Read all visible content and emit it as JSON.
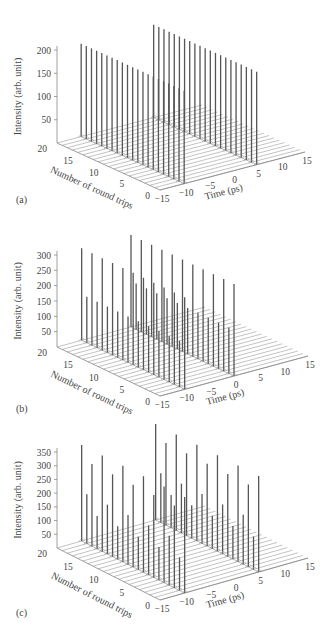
{
  "chart_data": [
    {
      "panel": "(a)",
      "type": "3d-waterfall",
      "xlabel": "Time (ps)",
      "ylabel": "Number of round trips",
      "zlabel": "Intensity (arb. unit)",
      "x_ticks": [
        "-15",
        "-10",
        "-5",
        "0",
        "5",
        "10",
        "15"
      ],
      "y_ticks": [
        "0",
        "5",
        "10",
        "15",
        "20"
      ],
      "z_ticks": [
        "50",
        "100",
        "150",
        "200"
      ],
      "xlim": [
        -15,
        15
      ],
      "ylim": [
        0,
        20
      ],
      "zlim": [
        0,
        200
      ],
      "description": "Two stable pulses per round trip at constant peak intensity",
      "pulse_times_ps": [
        -10,
        5
      ],
      "round_trips": [
        0,
        1,
        2,
        3,
        4,
        5,
        6,
        7,
        8,
        9,
        10,
        11,
        12,
        13,
        14,
        15,
        16,
        17,
        18,
        19,
        20
      ],
      "series": [
        {
          "name": "pulse at -10 ps",
          "values": [
            200,
            200,
            200,
            200,
            200,
            200,
            200,
            200,
            200,
            200,
            200,
            200,
            200,
            200,
            200,
            200,
            200,
            200,
            200,
            200,
            200
          ]
        },
        {
          "name": "pulse at 5 ps",
          "values": [
            200,
            200,
            200,
            200,
            200,
            200,
            200,
            200,
            200,
            200,
            200,
            200,
            200,
            200,
            200,
            200,
            200,
            200,
            200,
            200,
            200
          ]
        }
      ]
    },
    {
      "panel": "(b)",
      "type": "3d-waterfall",
      "xlabel": "Time (ps)",
      "ylabel": "Number of round trips",
      "zlabel": "Intensity (arb. unit)",
      "x_ticks": [
        "-15",
        "-10",
        "-5",
        "0",
        "5",
        "10",
        "15"
      ],
      "y_ticks": [
        "0",
        "5",
        "10",
        "15",
        "20"
      ],
      "z_ticks": [
        "50",
        "100",
        "150",
        "200",
        "250",
        "300"
      ],
      "xlim": [
        -15,
        15
      ],
      "ylim": [
        0,
        20
      ],
      "zlim": [
        0,
        300
      ],
      "description": "Two pulses per round trip with period-doubled (alternating) peak intensity",
      "pulse_times_ps": [
        -10,
        0
      ],
      "round_trips": [
        0,
        1,
        2,
        3,
        4,
        5,
        6,
        7,
        8,
        9,
        10,
        11,
        12,
        13,
        14,
        15,
        16,
        17,
        18,
        19,
        20
      ],
      "series": [
        {
          "name": "pulse at -10 ps",
          "values": [
            300,
            150,
            300,
            150,
            300,
            150,
            300,
            150,
            300,
            150,
            300,
            150,
            300,
            150,
            300,
            150,
            300,
            150,
            300,
            150,
            300
          ]
        },
        {
          "name": "pulse at 0 ps",
          "values": [
            300,
            150,
            300,
            150,
            300,
            150,
            300,
            150,
            300,
            150,
            300,
            150,
            300,
            150,
            300,
            150,
            300,
            150,
            300,
            150,
            300
          ]
        }
      ]
    },
    {
      "panel": "(c)",
      "type": "3d-waterfall",
      "xlabel": "Time (ps)",
      "ylabel": "Number of round trips",
      "zlabel": "Intensity (arb. unit)",
      "x_ticks": [
        "-15",
        "-10",
        "-5",
        "0",
        "5",
        "10",
        "15"
      ],
      "y_ticks": [
        "0",
        "5",
        "10",
        "15",
        "20"
      ],
      "z_ticks": [
        "50",
        "100",
        "150",
        "200",
        "250",
        "300",
        "350"
      ],
      "xlim": [
        -15,
        15
      ],
      "ylim": [
        0,
        20
      ],
      "zlim": [
        0,
        350
      ],
      "description": "Two pulses per round trip with period-quadrupled peak intensity",
      "pulse_times_ps": [
        -10,
        5
      ],
      "round_trips": [
        0,
        1,
        2,
        3,
        4,
        5,
        6,
        7,
        8,
        9,
        10,
        11,
        12,
        13,
        14,
        15,
        16,
        17,
        18,
        19,
        20
      ],
      "series": [
        {
          "name": "pulse at -10 ps",
          "values": [
            350,
            120,
            300,
            180,
            350,
            120,
            300,
            180,
            350,
            120,
            300,
            180,
            350,
            120,
            300,
            180,
            350,
            120,
            300,
            180,
            350
          ]
        },
        {
          "name": "pulse at 5 ps",
          "values": [
            350,
            120,
            300,
            180,
            350,
            120,
            300,
            180,
            350,
            120,
            300,
            180,
            350,
            120,
            300,
            180,
            350,
            120,
            300,
            180,
            350
          ]
        }
      ]
    }
  ],
  "panels": {
    "a": {
      "label": "(a)"
    },
    "b": {
      "label": "(b)"
    },
    "c": {
      "label": "(c)"
    }
  }
}
